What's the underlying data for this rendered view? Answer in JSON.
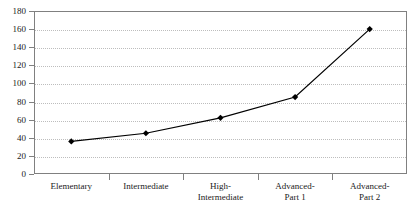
{
  "chart_data": {
    "type": "line",
    "title": "",
    "subtitle": "",
    "xlabel": "",
    "ylabel": "",
    "categories": [
      "Elementary",
      "Intermediate",
      "High-\nIntermediate",
      "Advanced-\nPart 1",
      "Advanced-\nPart 2"
    ],
    "values": [
      36,
      45,
      62,
      85,
      160
    ],
    "series": [
      {
        "name": "series-1",
        "values": [
          36,
          45,
          62,
          85,
          160
        ],
        "color": "#000000",
        "marker": "diamond"
      }
    ],
    "ylim": [
      0,
      180
    ],
    "ytick_step": 20,
    "yticks": [
      0,
      20,
      40,
      60,
      80,
      100,
      120,
      140,
      160,
      180
    ],
    "ytick_labels": [
      "0",
      "20",
      "40",
      "60",
      "80",
      "100",
      "120",
      "140",
      "160",
      "180"
    ],
    "grid": {
      "horizontal": true,
      "vertical": false,
      "style": "dotted",
      "color": "#bdbdbd"
    },
    "legend": {
      "visible": false,
      "position": "none",
      "entries": []
    },
    "frame": {
      "visible": true,
      "color": "#808080"
    },
    "annotations": []
  },
  "colors": {
    "line": "#000000",
    "marker": "#000000",
    "grid": "#bdbdbd",
    "axis": "#808080",
    "text": "#1a1a1a",
    "background": "#ffffff"
  }
}
